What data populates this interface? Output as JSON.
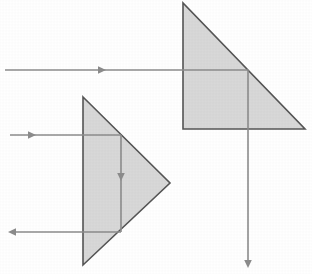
{
  "figure": {
    "title": "",
    "type": "optics-ray-diagram",
    "background_color": "#ffffff",
    "width": 312,
    "height": 274
  },
  "style": {
    "prism_fill": "#d8d8d8",
    "prism_stroke": "#555555",
    "prism_stroke_width": 1.6,
    "ray_color": "#8c8c8c",
    "ray_width": 1.6,
    "arrow_color": "#8c8c8c"
  },
  "prisms": [
    {
      "id": "prism-upper-right",
      "name": "upper-right-prism",
      "orientation": "right-triangle-apex-top-left",
      "vertices": [
        {
          "x": 183,
          "y": 3
        },
        {
          "x": 183,
          "y": 129
        },
        {
          "x": 305,
          "y": 129
        }
      ],
      "points_string": "183,3 183,129 305,129"
    },
    {
      "id": "prism-lower-left",
      "name": "lower-left-prism",
      "orientation": "isoceles-triangle-pointing-right",
      "vertices": [
        {
          "x": 83,
          "y": 97
        },
        {
          "x": 170,
          "y": 183
        },
        {
          "x": 83,
          "y": 265
        }
      ],
      "points_string": "83,97 170,183 83,265"
    }
  ],
  "rays": [
    {
      "id": "ray-incident-upper",
      "name": "incident-ray-upper",
      "direction": "rightward",
      "x1": 5,
      "y1": 70,
      "x2": 248,
      "y2": 70,
      "arrow": {
        "x": 106,
        "y": 70,
        "direction": "right"
      }
    },
    {
      "id": "ray-refracted-upper-vertical",
      "name": "refracted-ray-upper-vertical",
      "direction": "downward",
      "x1": 248,
      "y1": 70,
      "x2": 248,
      "y2": 262,
      "arrow": {
        "x": 248,
        "y": 268,
        "direction": "down"
      }
    },
    {
      "id": "ray-incident-lower",
      "name": "incident-ray-lower",
      "direction": "rightward",
      "x1": 10,
      "y1": 135,
      "x2": 121,
      "y2": 135,
      "arrow": {
        "x": 36,
        "y": 135,
        "direction": "right"
      }
    },
    {
      "id": "ray-internal-lower-vertical",
      "name": "internal-ray-lower-vertical",
      "direction": "downward",
      "x1": 121,
      "y1": 135,
      "x2": 121,
      "y2": 232,
      "arrow": {
        "x": 121,
        "y": 181,
        "direction": "down"
      }
    },
    {
      "id": "ray-exit-lower",
      "name": "exit-ray-lower-leftward",
      "direction": "leftward",
      "x1": 121,
      "y1": 232,
      "x2": 10,
      "y2": 232,
      "arrow": {
        "x": 8,
        "y": 232,
        "direction": "left"
      }
    }
  ],
  "labels": []
}
